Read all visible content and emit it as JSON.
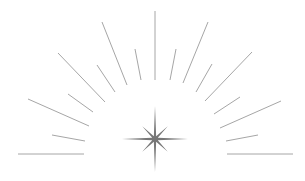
{
  "illustration": {
    "name": "starburst",
    "background": "#ffffff",
    "ray_color": "#a6a6a6",
    "star_color": "#777777",
    "rays": [
      {
        "x1": 155,
        "y1": 11,
        "x2": 155,
        "y2": 80
      },
      {
        "x1": 102,
        "y1": 22,
        "x2": 127,
        "y2": 85
      },
      {
        "x1": 135,
        "y1": 49,
        "x2": 141,
        "y2": 80
      },
      {
        "x1": 208,
        "y1": 22,
        "x2": 183,
        "y2": 83
      },
      {
        "x1": 176,
        "y1": 49,
        "x2": 170,
        "y2": 80
      },
      {
        "x1": 58,
        "y1": 53,
        "x2": 105,
        "y2": 102
      },
      {
        "x1": 97,
        "y1": 65,
        "x2": 115,
        "y2": 92
      },
      {
        "x1": 68,
        "y1": 94,
        "x2": 93,
        "y2": 112
      },
      {
        "x1": 28,
        "y1": 99,
        "x2": 89,
        "y2": 126
      },
      {
        "x1": 52,
        "y1": 135,
        "x2": 85,
        "y2": 141
      },
      {
        "x1": 18,
        "y1": 154,
        "x2": 84,
        "y2": 154
      },
      {
        "x1": 252,
        "y1": 52,
        "x2": 205,
        "y2": 101
      },
      {
        "x1": 212,
        "y1": 64,
        "x2": 196,
        "y2": 92
      },
      {
        "x1": 240,
        "y1": 97,
        "x2": 214,
        "y2": 114
      },
      {
        "x1": 281,
        "y1": 101,
        "x2": 220,
        "y2": 128
      },
      {
        "x1": 258,
        "y1": 135,
        "x2": 226,
        "y2": 141
      },
      {
        "x1": 293,
        "y1": 154,
        "x2": 227,
        "y2": 154
      }
    ],
    "star": {
      "cx": 155,
      "cy": 139,
      "long_arm": 33,
      "short_arm": 18,
      "waist": 3
    }
  }
}
